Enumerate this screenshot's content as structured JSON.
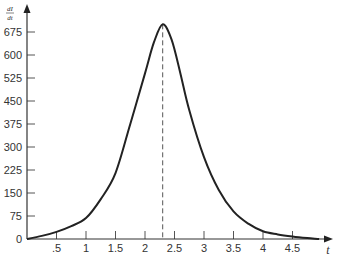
{
  "chart_data": {
    "type": "line",
    "title": "",
    "xlabel": "t",
    "ylabel": "dI/dt",
    "ylabel_num": "dI",
    "ylabel_den": "dt",
    "xlim": [
      0,
      5
    ],
    "ylim": [
      0,
      720
    ],
    "grid": false,
    "legend": null,
    "x_ticks": [
      0.5,
      1,
      1.5,
      2,
      2.5,
      3,
      3.5,
      4,
      4.5
    ],
    "x_tick_labels": [
      ".5",
      "1",
      "1.5",
      "2",
      "2.5",
      "3",
      "3.5",
      "4",
      "4.5"
    ],
    "y_ticks": [
      0,
      75,
      150,
      225,
      300,
      375,
      450,
      525,
      600,
      675
    ],
    "y_tick_labels": [
      "0",
      "75",
      "150",
      "225",
      "300",
      "375",
      "450",
      "525",
      "600",
      "675"
    ],
    "series": [
      {
        "name": "dI/dt",
        "x": [
          0,
          0.25,
          0.5,
          0.75,
          1.0,
          1.25,
          1.5,
          1.75,
          2.0,
          2.15,
          2.3,
          2.45,
          2.6,
          2.75,
          3.0,
          3.25,
          3.5,
          3.75,
          4.0,
          4.25,
          4.5,
          4.75,
          4.95
        ],
        "y": [
          0,
          10,
          23,
          42,
          68,
          130,
          215,
          375,
          540,
          640,
          700,
          650,
          540,
          420,
          267,
          160,
          90,
          50,
          25,
          15,
          8,
          3,
          0
        ]
      }
    ],
    "annotations": [
      {
        "type": "vertical-dashed-line",
        "x": 2.3,
        "label": "peak"
      }
    ]
  }
}
